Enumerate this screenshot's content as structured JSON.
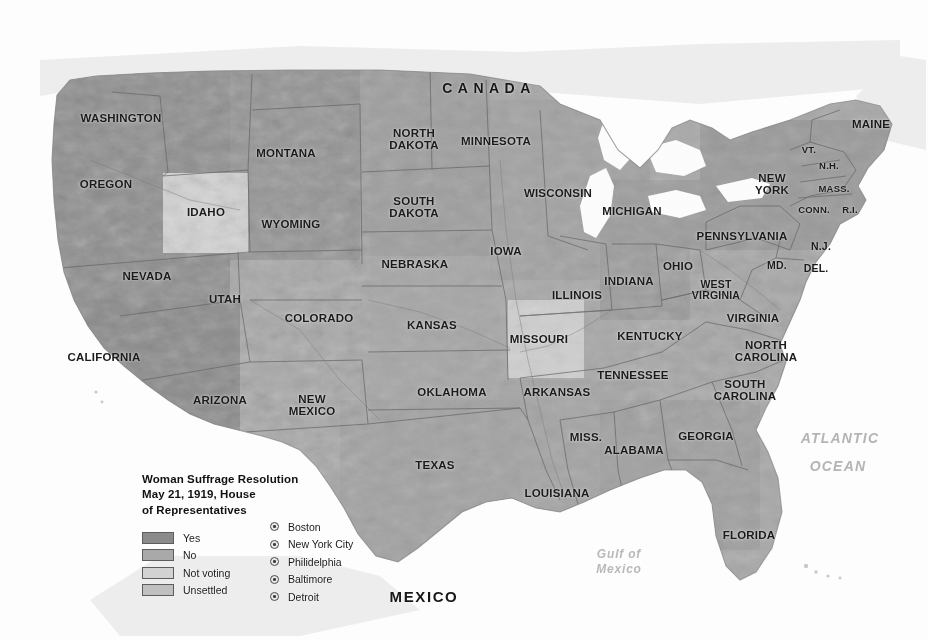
{
  "map": {
    "title_block": "Woman Suffrage Resolution\nMay 21, 1919, House\nof Representatives",
    "countries": [
      {
        "name": "CANADA",
        "x": 489,
        "y": 88
      },
      {
        "name": "MEXICO",
        "x": 424,
        "y": 597
      }
    ],
    "oceans": [
      {
        "name": "ATLANTIC",
        "x": 840,
        "y": 438
      },
      {
        "name": "OCEAN",
        "x": 838,
        "y": 466
      }
    ],
    "gulf": {
      "name": "Gulf of\nMexico",
      "x": 619,
      "y": 562
    },
    "states": [
      {
        "name": "WASHINGTON",
        "x": 121,
        "y": 118,
        "size": "s-md"
      },
      {
        "name": "OREGON",
        "x": 106,
        "y": 184,
        "size": "s-md"
      },
      {
        "name": "IDAHO",
        "x": 206,
        "y": 212,
        "size": "s-md"
      },
      {
        "name": "MONTANA",
        "x": 286,
        "y": 153,
        "size": "s-md"
      },
      {
        "name": "WYOMING",
        "x": 291,
        "y": 224,
        "size": "s-md"
      },
      {
        "name": "NEVADA",
        "x": 147,
        "y": 276,
        "size": "s-md"
      },
      {
        "name": "UTAH",
        "x": 225,
        "y": 299,
        "size": "s-md"
      },
      {
        "name": "CALIFORNIA",
        "x": 104,
        "y": 357,
        "size": "s-md"
      },
      {
        "name": "ARIZONA",
        "x": 220,
        "y": 400,
        "size": "s-md"
      },
      {
        "name": "COLORADO",
        "x": 319,
        "y": 318,
        "size": "s-md"
      },
      {
        "name": "NEW\nMEXICO",
        "x": 312,
        "y": 405,
        "size": "s-md"
      },
      {
        "name": "NORTH\nDAKOTA",
        "x": 414,
        "y": 139,
        "size": "s-md"
      },
      {
        "name": "SOUTH\nDAKOTA",
        "x": 414,
        "y": 207,
        "size": "s-md"
      },
      {
        "name": "NEBRASKA",
        "x": 415,
        "y": 264,
        "size": "s-md"
      },
      {
        "name": "KANSAS",
        "x": 432,
        "y": 325,
        "size": "s-md"
      },
      {
        "name": "OKLAHOMA",
        "x": 452,
        "y": 392,
        "size": "s-md"
      },
      {
        "name": "TEXAS",
        "x": 435,
        "y": 465,
        "size": "s-md"
      },
      {
        "name": "MINNESOTA",
        "x": 496,
        "y": 141,
        "size": "s-md"
      },
      {
        "name": "IOWA",
        "x": 506,
        "y": 251,
        "size": "s-md"
      },
      {
        "name": "MISSOURI",
        "x": 539,
        "y": 339,
        "size": "s-md"
      },
      {
        "name": "ARKANSAS",
        "x": 557,
        "y": 392,
        "size": "s-md"
      },
      {
        "name": "LOUISIANA",
        "x": 557,
        "y": 493,
        "size": "s-md"
      },
      {
        "name": "WISCONSIN",
        "x": 558,
        "y": 193,
        "size": "s-md"
      },
      {
        "name": "ILLINOIS",
        "x": 577,
        "y": 295,
        "size": "s-md"
      },
      {
        "name": "MICHIGAN",
        "x": 632,
        "y": 211,
        "size": "s-md"
      },
      {
        "name": "INDIANA",
        "x": 629,
        "y": 281,
        "size": "s-md"
      },
      {
        "name": "OHIO",
        "x": 678,
        "y": 266,
        "size": "s-md"
      },
      {
        "name": "KENTUCKY",
        "x": 650,
        "y": 336,
        "size": "s-md"
      },
      {
        "name": "TENNESSEE",
        "x": 633,
        "y": 375,
        "size": "s-md"
      },
      {
        "name": "MISS.",
        "x": 586,
        "y": 437,
        "size": "s-md"
      },
      {
        "name": "ALABAMA",
        "x": 634,
        "y": 450,
        "size": "s-md"
      },
      {
        "name": "GEORGIA",
        "x": 706,
        "y": 436,
        "size": "s-md"
      },
      {
        "name": "FLORIDA",
        "x": 749,
        "y": 535,
        "size": "s-md"
      },
      {
        "name": "SOUTH\nCAROLINA",
        "x": 745,
        "y": 390,
        "size": "s-md"
      },
      {
        "name": "NORTH\nCAROLINA",
        "x": 766,
        "y": 351,
        "size": "s-md"
      },
      {
        "name": "VIRGINIA",
        "x": 753,
        "y": 318,
        "size": "s-md"
      },
      {
        "name": "WEST\nVIRGINIA",
        "x": 716,
        "y": 290,
        "size": "s-sm"
      },
      {
        "name": "PENNSYLVANIA",
        "x": 742,
        "y": 236,
        "size": "s-md"
      },
      {
        "name": "MD.",
        "x": 777,
        "y": 266,
        "size": "s-sm"
      },
      {
        "name": "DEL.",
        "x": 816,
        "y": 269,
        "size": "s-sm"
      },
      {
        "name": "N.J.",
        "x": 821,
        "y": 247,
        "size": "s-sm"
      },
      {
        "name": "NEW\nYORK",
        "x": 772,
        "y": 184,
        "size": "s-md"
      },
      {
        "name": "CONN.",
        "x": 814,
        "y": 210,
        "size": "s-xs"
      },
      {
        "name": "R.I.",
        "x": 850,
        "y": 210,
        "size": "s-xs"
      },
      {
        "name": "MASS.",
        "x": 834,
        "y": 189,
        "size": "s-xs"
      },
      {
        "name": "N.H.",
        "x": 829,
        "y": 166,
        "size": "s-xs"
      },
      {
        "name": "VT.",
        "x": 809,
        "y": 150,
        "size": "s-xs"
      },
      {
        "name": "MAINE",
        "x": 871,
        "y": 124,
        "size": "s-md"
      }
    ],
    "legend": {
      "swatches": [
        {
          "label": "Yes",
          "color": "#8b8b8b"
        },
        {
          "label": "No",
          "color": "#a9a9a9"
        },
        {
          "label": "Not voting",
          "color": "#d2d2d2"
        },
        {
          "label": "Unsettled",
          "color": "#c0c0c0"
        }
      ],
      "cities": [
        {
          "label": "Boston"
        },
        {
          "label": "New York City"
        },
        {
          "label": "Philidelphia"
        },
        {
          "label": "Baltimore"
        },
        {
          "label": "Detroit"
        }
      ]
    }
  }
}
